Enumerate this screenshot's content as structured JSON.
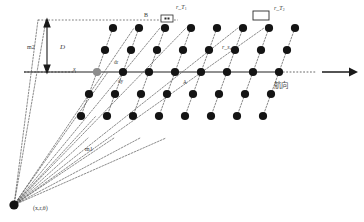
{
  "diagram": {
    "colors": {
      "dot": "#141414",
      "dot_highlight": "#8c8c8c",
      "axis": "#6b6b6b",
      "dashed": "#2a2a2a",
      "text": "#3a3a3a",
      "background": "#ffffff"
    },
    "labels": {
      "baseline_b": "B",
      "transmitter_1": "r_T",
      "transmitter_1_sub": "1",
      "transmitter_2": "r_T",
      "transmitter_2_sub": "2",
      "range_slant": "r_s",
      "range_slant_sub": "x",
      "depth_d": "D",
      "margin_m2": "m2",
      "margin_m1": "m1",
      "axis_x": "x",
      "delta_r": "dr",
      "delta_y": "dy",
      "heading_cjk": "航向",
      "source_coords": "(x,r,θ)",
      "a_point": "A"
    },
    "geometry": {
      "source_point": {
        "x": 14,
        "y": 205
      },
      "axis_y": 72,
      "top_dashed_y": 20,
      "arrow": {
        "x1": 322,
        "y1": 72,
        "x2": 358,
        "y2": 72
      },
      "row_count": 5,
      "dots_per_row": 8,
      "row_spacing": 22,
      "col_spacing": 26,
      "shear_per_row": -8,
      "grid_origin": {
        "x": 113,
        "y": 28
      }
    },
    "icons": {
      "transmitter": "radar-transmitter-icon",
      "direction": "heading-arrow-icon",
      "dimension": "dimension-arrow-icon"
    }
  }
}
